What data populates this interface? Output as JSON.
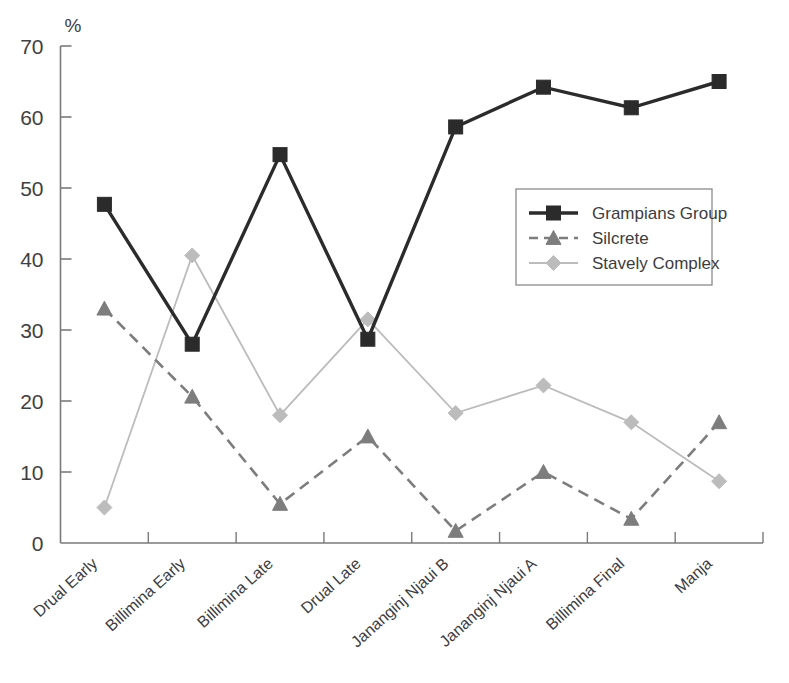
{
  "chart_data": {
    "type": "line",
    "title": "",
    "xlabel": "",
    "ylabel": "",
    "yunit": "%",
    "ylim": [
      0,
      70
    ],
    "yticks": [
      0,
      10,
      20,
      30,
      40,
      50,
      60,
      70
    ],
    "ytick_labels": [
      "0",
      "10",
      "20",
      "30",
      "40",
      "50",
      "60",
      "70"
    ],
    "grid": false,
    "legend_position": "upper-right-inside",
    "categories": [
      "Drual Early",
      "Billimina Early",
      "Billimina Late",
      "Drual Late",
      "Jananginj Njaui B",
      "Jananginj Njaui A",
      "Billimina Final",
      "Manja"
    ],
    "series": [
      {
        "name": "Grampians Group",
        "color": "#2b2b2b",
        "line_style": "solid",
        "line_width": 3.4,
        "marker": "square",
        "values": [
          47.7,
          28.0,
          54.7,
          28.7,
          58.6,
          64.2,
          61.3,
          65.0
        ]
      },
      {
        "name": "Silcrete",
        "color": "#7d7d7d",
        "line_style": "dashed",
        "line_width": 2.6,
        "marker": "triangle",
        "values": [
          33.0,
          20.6,
          5.5,
          15.0,
          1.7,
          10.0,
          3.4,
          17.0
        ]
      },
      {
        "name": "Stavely Complex",
        "color": "#bcbcbc",
        "line_style": "solid",
        "line_width": 1.8,
        "marker": "diamond",
        "values": [
          5.0,
          40.5,
          18.0,
          31.5,
          18.3,
          22.2,
          17.0,
          8.7
        ]
      }
    ]
  },
  "axes": {
    "unit_symbol": "%",
    "axis_color": "#7a7a7a"
  },
  "legend": {
    "entries": [
      {
        "label": "Grampians Group"
      },
      {
        "label": "Silcrete"
      },
      {
        "label": "Stavely Complex"
      }
    ]
  }
}
